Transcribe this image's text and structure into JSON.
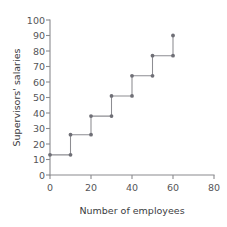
{
  "chart_data": {
    "type": "line",
    "subtype": "step-function",
    "title": "",
    "xlabel": "Number of employees",
    "ylabel": "Supervisors' salaries",
    "xlim": [
      0,
      80
    ],
    "ylim": [
      0,
      100
    ],
    "xticks": [
      0,
      20,
      40,
      60,
      80
    ],
    "yticks": [
      0,
      10,
      20,
      30,
      40,
      50,
      60,
      70,
      80,
      90,
      100
    ],
    "xticklabels": [
      "0",
      "20",
      "40",
      "60",
      "80"
    ],
    "yticklabels": [
      "0",
      "10",
      "20",
      "30",
      "40",
      "50",
      "60",
      "70",
      "80",
      "90",
      "100"
    ],
    "grid": false,
    "legend": false,
    "legend_position": "none",
    "line_color": "#8d8d92",
    "marker_color": "#6f6f76",
    "axis_color": "#8a8a8e",
    "steps": [
      {
        "x_start": 0,
        "x_end": 10,
        "y": 13
      },
      {
        "x_start": 10,
        "x_end": 20,
        "y": 26
      },
      {
        "x_start": 20,
        "x_end": 30,
        "y": 38
      },
      {
        "x_start": 30,
        "x_end": 40,
        "y": 51
      },
      {
        "x_start": 40,
        "x_end": 50,
        "y": 64
      },
      {
        "x_start": 50,
        "x_end": 60,
        "y": 77
      }
    ],
    "points": [
      {
        "x": 0,
        "y": 13
      },
      {
        "x": 10,
        "y": 13
      },
      {
        "x": 10,
        "y": 26
      },
      {
        "x": 20,
        "y": 26
      },
      {
        "x": 20,
        "y": 38
      },
      {
        "x": 30,
        "y": 38
      },
      {
        "x": 30,
        "y": 51
      },
      {
        "x": 40,
        "y": 51
      },
      {
        "x": 40,
        "y": 64
      },
      {
        "x": 50,
        "y": 64
      },
      {
        "x": 50,
        "y": 77
      },
      {
        "x": 60,
        "y": 77
      },
      {
        "x": 60,
        "y": 90
      }
    ],
    "x": [
      0,
      10,
      10,
      20,
      20,
      30,
      30,
      40,
      40,
      50,
      50,
      60,
      60
    ],
    "values": [
      13,
      13,
      26,
      26,
      38,
      38,
      51,
      51,
      64,
      64,
      77,
      77,
      90
    ]
  }
}
